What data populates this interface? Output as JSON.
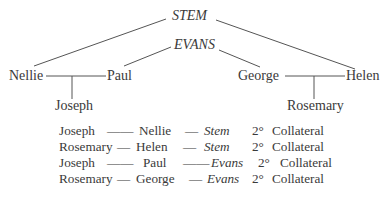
{
  "diagram": {
    "nodes": {
      "stem": "STEM",
      "evans": "EVANS",
      "nellie": "Nellie",
      "paul": "Paul",
      "george": "George",
      "helen": "Helen",
      "joseph": "Joseph",
      "rosemary": "Rosemary"
    },
    "edges": [
      [
        "STEM",
        "Nellie"
      ],
      [
        "STEM",
        "Helen"
      ],
      [
        "EVANS",
        "Paul"
      ],
      [
        "EVANS",
        "George"
      ],
      [
        "Nellie",
        "Paul"
      ],
      [
        "George",
        "Helen"
      ],
      [
        "Nellie-Paul",
        "Joseph"
      ],
      [
        "George-Helen",
        "Rosemary"
      ]
    ]
  },
  "table": {
    "rows": [
      {
        "person": "Joseph",
        "dash1": "——",
        "parent": "Nellie",
        "dash2": "—",
        "ancestor": "Stem",
        "degree": "2°",
        "relation": "Collateral"
      },
      {
        "person": "Rosemary",
        "dash1": "—",
        "parent": "Helen",
        "dash2": "—",
        "ancestor": "Stem",
        "degree": "2°",
        "relation": "Collateral"
      },
      {
        "person": "Joseph",
        "dash1": "——",
        "parent": "Paul",
        "dash2": "——",
        "ancestor": "Evans",
        "degree": "2°",
        "relation": "Collateral"
      },
      {
        "person": "Rosemary",
        "dash1": "—",
        "parent": "George",
        "dash2": "—",
        "ancestor": "Evans",
        "degree": "2°",
        "relation": "Collateral"
      }
    ]
  }
}
